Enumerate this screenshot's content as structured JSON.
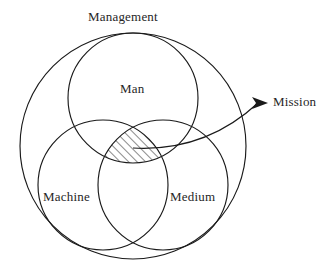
{
  "diagram": {
    "title_text": "",
    "type": "venn-diagram",
    "background_color": "#ffffff",
    "stroke_color": "#1a1a1a",
    "labels": {
      "outer": "Management",
      "top": "Man",
      "bottom_left": "Machine",
      "bottom_right": "Medium",
      "callout": "Mission"
    },
    "regions": [
      {
        "name": "management-circle",
        "label": "Management",
        "cx": 133,
        "cy": 146,
        "r": 113
      },
      {
        "name": "man-circle",
        "label": "Man",
        "cx": 133,
        "cy": 98,
        "r": 65
      },
      {
        "name": "machine-circle",
        "label": "Machine",
        "cx": 103,
        "cy": 185,
        "r": 65
      },
      {
        "name": "medium-circle",
        "label": "Medium",
        "cx": 163,
        "cy": 185,
        "r": 65
      }
    ],
    "highlight": {
      "name": "triple-intersection",
      "label": "Mission",
      "fill_pattern": "diagonal-hatch"
    },
    "callout": {
      "label": "Mission",
      "arrow_from_x": 157,
      "arrow_from_y": 142,
      "arrow_to_x": 268,
      "arrow_to_y": 103
    }
  }
}
